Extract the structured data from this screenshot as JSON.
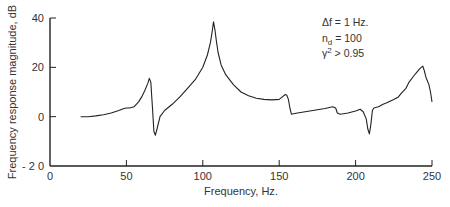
{
  "chart_data": {
    "type": "line",
    "title": "",
    "xlabel": "Frequency, Hz.",
    "ylabel": "Frequency response magnitude, dB",
    "xlim": [
      0,
      250
    ],
    "ylim": [
      -20,
      40
    ],
    "xticks": [
      0,
      50,
      100,
      150,
      200,
      250
    ],
    "yticks": [
      -20,
      0,
      20,
      40
    ],
    "xtick_labels": [
      "0",
      "50",
      "100",
      "150",
      "200",
      "250"
    ],
    "ytick_labels": [
      "- 2 0",
      "0",
      "20",
      "40"
    ],
    "grid": false,
    "legend": null,
    "annotations": [
      {
        "text": "Δf = 1 Hz.",
        "x": 172,
        "y": 36
      },
      {
        "text": "n_d = 100",
        "x": 172,
        "y": 31
      },
      {
        "text": "γ² > 0.95",
        "x": 172,
        "y": 26
      }
    ],
    "series": [
      {
        "name": "Frequency response magnitude",
        "x": [
          20,
          25,
          30,
          35,
          40,
          45,
          48,
          50,
          52,
          55,
          58,
          60,
          62,
          64,
          65,
          66,
          67,
          68,
          69,
          70,
          72,
          75,
          80,
          85,
          90,
          95,
          100,
          103,
          105,
          106,
          107,
          108,
          109,
          110,
          112,
          115,
          120,
          125,
          130,
          135,
          140,
          145,
          150,
          152,
          154,
          155,
          156,
          157,
          158,
          160,
          165,
          170,
          175,
          180,
          185,
          187,
          188,
          190,
          195,
          200,
          203,
          205,
          207,
          208,
          209,
          210,
          211,
          212,
          215,
          218,
          220,
          225,
          228,
          230,
          233,
          235,
          238,
          240,
          242,
          244,
          245,
          246,
          248,
          249,
          250
        ],
        "values": [
          0,
          0,
          0.3,
          0.8,
          1.5,
          2.5,
          3.2,
          3.5,
          3.5,
          4,
          6,
          8,
          10.5,
          13.5,
          15.5,
          14,
          4,
          -6,
          -7.5,
          -5,
          0,
          2.5,
          5,
          8,
          11.5,
          15,
          20,
          25,
          30,
          34,
          38.5,
          35,
          30,
          26,
          21,
          17,
          13,
          10,
          8.5,
          7.5,
          7,
          6.8,
          7,
          8,
          9,
          8.7,
          7,
          3.5,
          1,
          1.3,
          1.8,
          2.3,
          2.8,
          3.3,
          4,
          3.5,
          1.5,
          1,
          1.5,
          2.3,
          3,
          2,
          -1,
          -5,
          -7,
          -3,
          2.5,
          3.5,
          4,
          5,
          5.5,
          7,
          8,
          9.5,
          11.5,
          14,
          16.5,
          18,
          19.5,
          20.5,
          18.5,
          16,
          13,
          10,
          6
        ]
      }
    ]
  }
}
